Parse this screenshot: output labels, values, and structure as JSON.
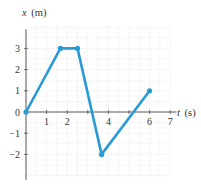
{
  "chart_data": {
    "type": "line",
    "title": "",
    "xlabel": "t (s)",
    "ylabel": "x (m)",
    "xlabel_var": "t",
    "xlabel_unit": "(s)",
    "ylabel_var": "x",
    "ylabel_unit": "(m)",
    "x_ticks": [
      "1",
      "2",
      "4",
      "6",
      "7"
    ],
    "y_ticks": [
      "3",
      "2",
      "1",
      "0",
      "−1",
      "−2"
    ],
    "xlim": [
      0,
      7.5
    ],
    "ylim": [
      -3,
      4
    ],
    "grid": true,
    "series": [
      {
        "name": "position",
        "color": "#2a9ad4",
        "points": [
          {
            "t": 0,
            "x": 0
          },
          {
            "t": 1.67,
            "x": 3
          },
          {
            "t": 2.5,
            "x": 3
          },
          {
            "t": 3.67,
            "x": -2
          },
          {
            "t": 6,
            "x": 1
          }
        ]
      }
    ]
  },
  "colors": {
    "line": "#2a9ad4",
    "axis": "#555555",
    "grid": "#d8d8d8"
  }
}
